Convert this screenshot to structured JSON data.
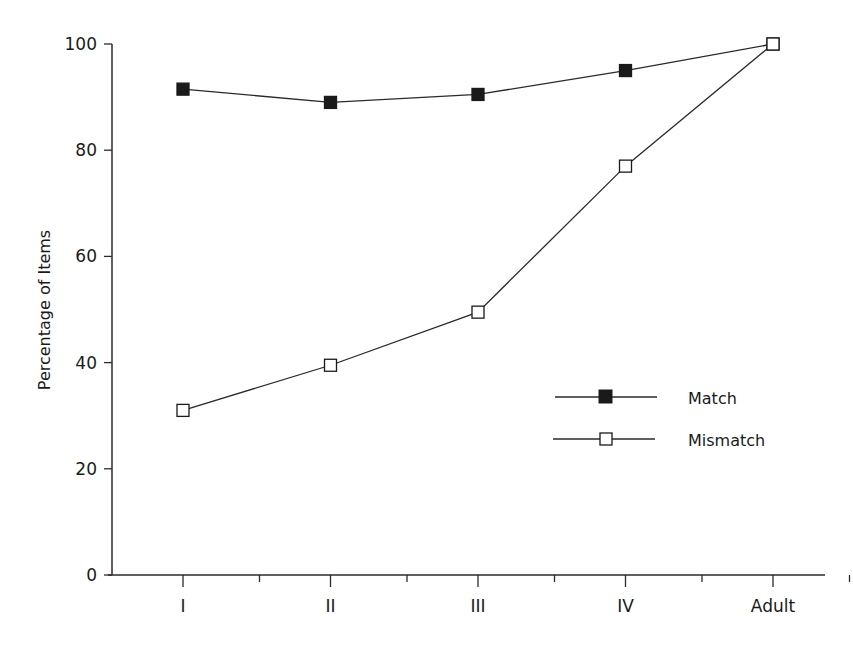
{
  "chart_data": {
    "type": "line",
    "title": "",
    "xlabel": "",
    "ylabel": "Percentage of Items",
    "categories": [
      "I",
      "II",
      "III",
      "IV",
      "Adult"
    ],
    "series": [
      {
        "name": "Match",
        "marker": "filled-square",
        "values": [
          91.5,
          89,
          90.5,
          95,
          100
        ]
      },
      {
        "name": "Mismatch",
        "marker": "open-square",
        "values": [
          31,
          39.5,
          49.5,
          77,
          100
        ]
      }
    ],
    "ylim": [
      0,
      100
    ],
    "yticks": [
      0,
      20,
      40,
      60,
      80,
      100
    ],
    "grid": false,
    "legend_position": "lower-right-inside"
  },
  "colors": {
    "line": "#2a2a2a",
    "filled_marker": "#1a1a1a",
    "open_marker_fill": "#ffffff",
    "background": "#ffffff"
  }
}
